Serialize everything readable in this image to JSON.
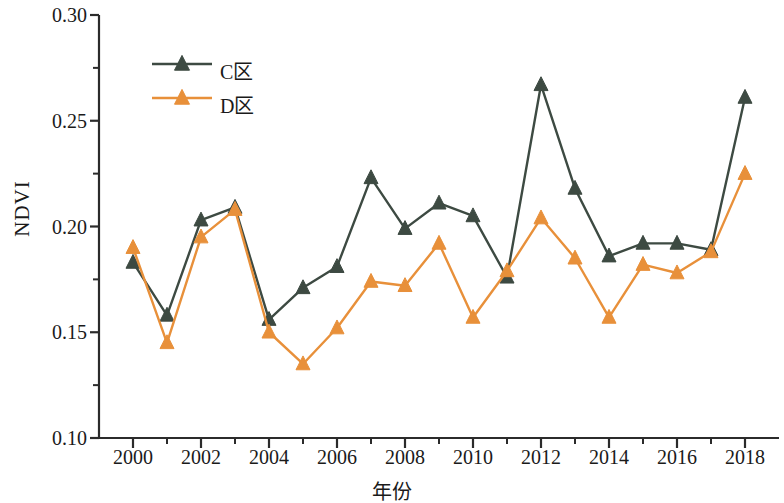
{
  "chart_data": {
    "type": "line",
    "title": "",
    "xlabel": "年份",
    "ylabel": "NDVI",
    "x": [
      2000,
      2001,
      2002,
      2003,
      2004,
      2005,
      2006,
      2007,
      2008,
      2009,
      2010,
      2011,
      2012,
      2013,
      2014,
      2015,
      2016,
      2017,
      2018
    ],
    "xlim": [
      1999,
      2019
    ],
    "ylim": [
      0.1,
      0.3
    ],
    "ytick_labels": [
      "0.10",
      "0.15",
      "0.20",
      "0.25",
      "0.30"
    ],
    "ytick_values": [
      0.1,
      0.15,
      0.2,
      0.25,
      0.3
    ],
    "yminor_values": [
      0.125,
      0.175,
      0.225,
      0.275
    ],
    "xtick_labels": [
      "2000",
      "2002",
      "2004",
      "2006",
      "2008",
      "2010",
      "2012",
      "2014",
      "2016",
      "2018"
    ],
    "xtick_values": [
      2000,
      2002,
      2004,
      2006,
      2008,
      2010,
      2012,
      2014,
      2016,
      2018
    ],
    "xminor_values": [
      2001,
      2003,
      2005,
      2007,
      2009,
      2011,
      2013,
      2015,
      2017
    ],
    "grid": false,
    "legend_position": "upper-left",
    "marker": "triangle",
    "series": [
      {
        "name": "C区",
        "color": "#3d4a42",
        "values": [
          0.183,
          0.158,
          0.203,
          0.209,
          0.156,
          0.171,
          0.181,
          0.223,
          0.199,
          0.211,
          0.205,
          0.176,
          0.267,
          0.218,
          0.186,
          0.192,
          0.192,
          0.189,
          0.261
        ]
      },
      {
        "name": "D区",
        "color": "#e8903a",
        "values": [
          0.19,
          0.145,
          0.195,
          0.208,
          0.15,
          0.135,
          0.152,
          0.174,
          0.172,
          0.192,
          0.157,
          0.179,
          0.204,
          0.185,
          0.157,
          0.182,
          0.178,
          0.188,
          0.225
        ]
      }
    ]
  },
  "axis": {
    "color": "#2b2b2b"
  }
}
